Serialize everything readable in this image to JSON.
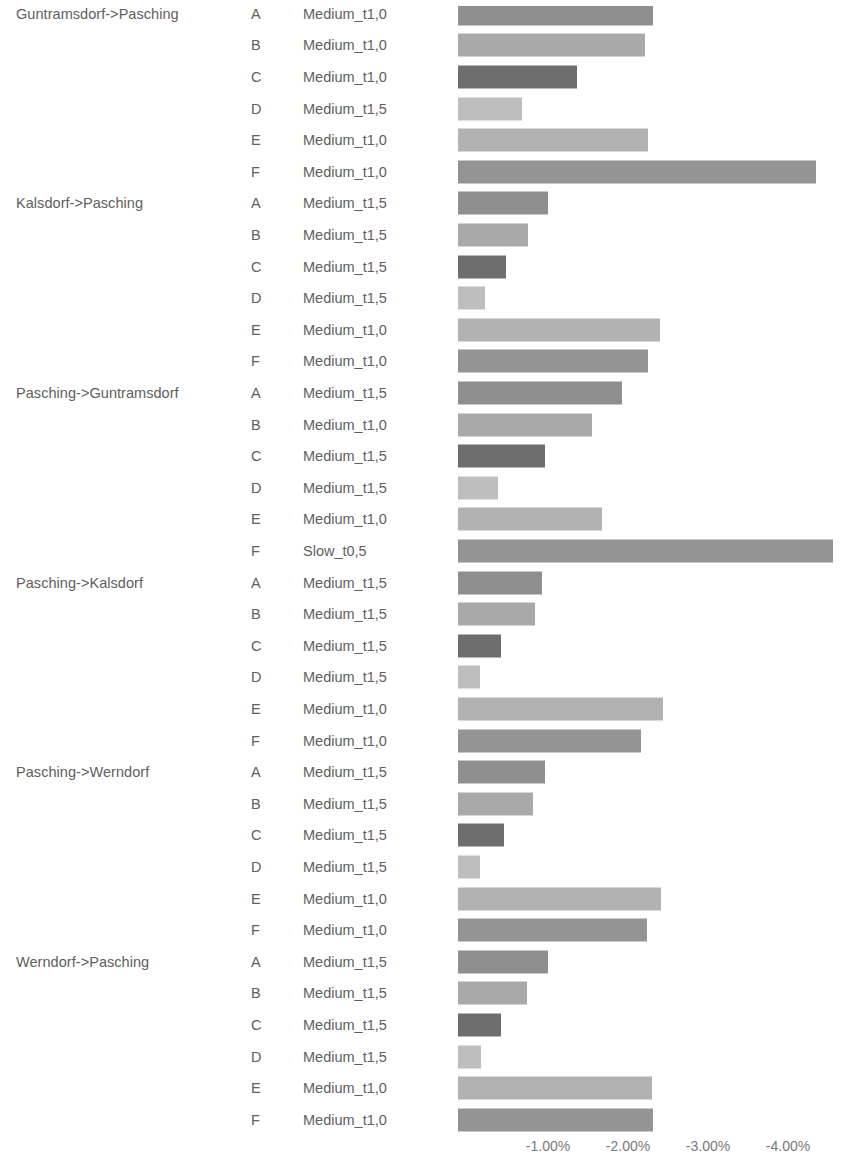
{
  "chart_data": {
    "type": "bar",
    "orientation": "horizontal",
    "title": "",
    "xlabel": "",
    "ylabel": "",
    "grid": false,
    "legend": "none",
    "x_tick_labels": [
      "-1.00%",
      "-2.00%",
      "-3.00%",
      "-4.00%"
    ],
    "x_tick_values": [
      -1.0,
      -2.0,
      -3.0,
      -4.0
    ],
    "xlim": [
      0,
      -4.7
    ],
    "axis_origin_px": 458,
    "px_per_percent": 80,
    "value_format": "percent",
    "groups": [
      {
        "label": "Guntramsdorf->Pasching",
        "rows": [
          {
            "segment": "A",
            "category": "Medium_t1,0",
            "value": -2.44,
            "color": "#8f8f8f"
          },
          {
            "segment": "B",
            "category": "Medium_t1,0",
            "value": -2.34,
            "color": "#a9a9a9"
          },
          {
            "segment": "C",
            "category": "Medium_t1,0",
            "value": -1.49,
            "color": "#6e6e6e"
          },
          {
            "segment": "D",
            "category": "Medium_t1,5",
            "value": -0.8,
            "color": "#bebebe"
          },
          {
            "segment": "E",
            "category": "Medium_t1,0",
            "value": -2.38,
            "color": "#b2b2b2"
          },
          {
            "segment": "F",
            "category": "Medium_t1,0",
            "value": -4.48,
            "color": "#949494"
          }
        ]
      },
      {
        "label": "Kalsdorf->Pasching",
        "rows": [
          {
            "segment": "A",
            "category": "Medium_t1,5",
            "value": -1.13,
            "color": "#8f8f8f"
          },
          {
            "segment": "B",
            "category": "Medium_t1,5",
            "value": -0.88,
            "color": "#a9a9a9"
          },
          {
            "segment": "C",
            "category": "Medium_t1,5",
            "value": -0.6,
            "color": "#6e6e6e"
          },
          {
            "segment": "D",
            "category": "Medium_t1,5",
            "value": -0.34,
            "color": "#bebebe"
          },
          {
            "segment": "E",
            "category": "Medium_t1,0",
            "value": -2.53,
            "color": "#b2b2b2"
          },
          {
            "segment": "F",
            "category": "Medium_t1,0",
            "value": -2.38,
            "color": "#949494"
          }
        ]
      },
      {
        "label": "Pasching->Guntramsdorf",
        "rows": [
          {
            "segment": "A",
            "category": "Medium_t1,5",
            "value": -2.05,
            "color": "#8f8f8f"
          },
          {
            "segment": "B",
            "category": "Medium_t1,0",
            "value": -1.68,
            "color": "#a9a9a9"
          },
          {
            "segment": "C",
            "category": "Medium_t1,5",
            "value": -1.09,
            "color": "#6e6e6e"
          },
          {
            "segment": "D",
            "category": "Medium_t1,5",
            "value": -0.5,
            "color": "#bebebe"
          },
          {
            "segment": "E",
            "category": "Medium_t1,0",
            "value": -1.8,
            "color": "#b2b2b2"
          },
          {
            "segment": "F",
            "category": "Slow_t0,5",
            "value": -4.69,
            "color": "#949494"
          }
        ]
      },
      {
        "label": "Pasching->Kalsdorf",
        "rows": [
          {
            "segment": "A",
            "category": "Medium_t1,5",
            "value": -1.05,
            "color": "#8f8f8f"
          },
          {
            "segment": "B",
            "category": "Medium_t1,5",
            "value": -0.96,
            "color": "#a9a9a9"
          },
          {
            "segment": "C",
            "category": "Medium_t1,5",
            "value": -0.54,
            "color": "#6e6e6e"
          },
          {
            "segment": "D",
            "category": "Medium_t1,5",
            "value": -0.28,
            "color": "#bebebe"
          },
          {
            "segment": "E",
            "category": "Medium_t1,0",
            "value": -2.56,
            "color": "#b2b2b2"
          },
          {
            "segment": "F",
            "category": "Medium_t1,0",
            "value": -2.29,
            "color": "#949494"
          }
        ]
      },
      {
        "label": "Pasching->Werndorf",
        "rows": [
          {
            "segment": "A",
            "category": "Medium_t1,5",
            "value": -1.09,
            "color": "#8f8f8f"
          },
          {
            "segment": "B",
            "category": "Medium_t1,5",
            "value": -0.94,
            "color": "#a9a9a9"
          },
          {
            "segment": "C",
            "category": "Medium_t1,5",
            "value": -0.58,
            "color": "#6e6e6e"
          },
          {
            "segment": "D",
            "category": "Medium_t1,5",
            "value": -0.28,
            "color": "#bebebe"
          },
          {
            "segment": "E",
            "category": "Medium_t1,0",
            "value": -2.54,
            "color": "#b2b2b2"
          },
          {
            "segment": "F",
            "category": "Medium_t1,0",
            "value": -2.36,
            "color": "#949494"
          }
        ]
      },
      {
        "label": "Werndorf->Pasching",
        "rows": [
          {
            "segment": "A",
            "category": "Medium_t1,5",
            "value": -1.13,
            "color": "#8f8f8f"
          },
          {
            "segment": "B",
            "category": "Medium_t1,5",
            "value": -0.86,
            "color": "#a9a9a9"
          },
          {
            "segment": "C",
            "category": "Medium_t1,5",
            "value": -0.54,
            "color": "#6e6e6e"
          },
          {
            "segment": "D",
            "category": "Medium_t1,5",
            "value": -0.29,
            "color": "#bebebe"
          },
          {
            "segment": "E",
            "category": "Medium_t1,0",
            "value": -2.43,
            "color": "#b2b2b2"
          },
          {
            "segment": "F",
            "category": "Medium_t1,0",
            "value": -2.44,
            "color": "#949494"
          }
        ]
      }
    ]
  }
}
